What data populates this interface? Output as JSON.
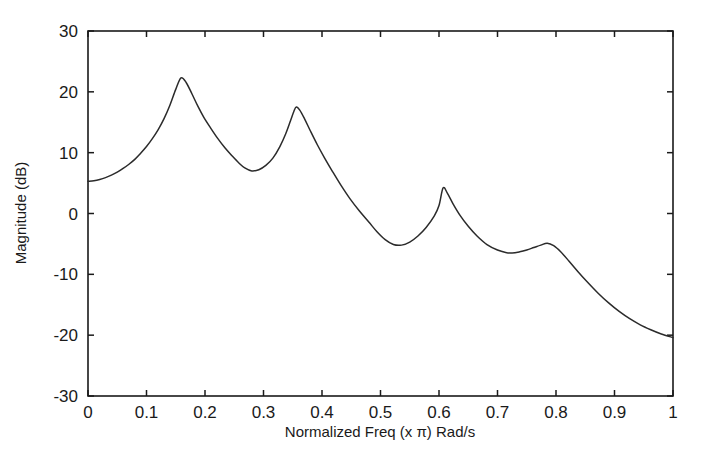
{
  "chart_data": {
    "type": "line",
    "title": "",
    "xlabel": "Normalized Freq (x π) Rad/s",
    "ylabel": "Magnitude (dB)",
    "xlim": [
      0,
      1
    ],
    "ylim": [
      -30,
      30
    ],
    "grid": false,
    "legend": null,
    "xticks": [
      0,
      0.1,
      0.2,
      0.3,
      0.4,
      0.5,
      0.6,
      0.7,
      0.8,
      0.9,
      1
    ],
    "xticklabels": [
      "0",
      "0.1",
      "0.2",
      "0.3",
      "0.4",
      "0.5",
      "0.6",
      "0.7",
      "0.8",
      "0.9",
      "1"
    ],
    "yticks": [
      30,
      20,
      10,
      0,
      -10,
      -20,
      -30
    ],
    "yticklabels": [
      "30",
      "20",
      "10",
      "0",
      "-10",
      "-20",
      "-30"
    ],
    "series": [
      {
        "name": "magnitude-response",
        "color": "#2b2b2b",
        "x": [
          0.0,
          0.01,
          0.02,
          0.03,
          0.04,
          0.05,
          0.06,
          0.07,
          0.08,
          0.09,
          0.1,
          0.11,
          0.12,
          0.13,
          0.14,
          0.15,
          0.159,
          0.168,
          0.178,
          0.188,
          0.198,
          0.21,
          0.222,
          0.234,
          0.246,
          0.258,
          0.268,
          0.28,
          0.292,
          0.304,
          0.316,
          0.328,
          0.338,
          0.346,
          0.352,
          0.356,
          0.362,
          0.37,
          0.38,
          0.392,
          0.404,
          0.418,
          0.432,
          0.448,
          0.464,
          0.48,
          0.494,
          0.508,
          0.522,
          0.536,
          0.55,
          0.564,
          0.578,
          0.592,
          0.6,
          0.607,
          0.614,
          0.624,
          0.636,
          0.65,
          0.665,
          0.682,
          0.7,
          0.714,
          0.725,
          0.738,
          0.75,
          0.762,
          0.774,
          0.785,
          0.796,
          0.808,
          0.822,
          0.838,
          0.854,
          0.872,
          0.89,
          0.908,
          0.926,
          0.944,
          0.962,
          0.98,
          1.0
        ],
        "y": [
          5.3,
          5.4,
          5.6,
          5.9,
          6.3,
          6.8,
          7.4,
          8.1,
          8.9,
          9.9,
          11.0,
          12.3,
          13.8,
          15.6,
          17.8,
          20.4,
          22.3,
          21.5,
          19.6,
          17.6,
          15.8,
          14.0,
          12.3,
          10.8,
          9.5,
          8.3,
          7.5,
          7.0,
          7.2,
          7.9,
          9.1,
          11.0,
          13.1,
          15.2,
          16.8,
          17.5,
          17.0,
          15.6,
          13.6,
          11.3,
          9.2,
          6.9,
          4.7,
          2.4,
          0.4,
          -1.4,
          -3.0,
          -4.3,
          -5.1,
          -5.2,
          -4.7,
          -3.7,
          -2.3,
          -0.4,
          1.3,
          4.2,
          3.4,
          1.6,
          -0.3,
          -2.1,
          -3.7,
          -5.1,
          -6.0,
          -6.4,
          -6.5,
          -6.3,
          -6.0,
          -5.6,
          -5.2,
          -4.9,
          -5.3,
          -6.3,
          -7.8,
          -9.6,
          -11.3,
          -13.1,
          -14.7,
          -16.1,
          -17.3,
          -18.3,
          -19.1,
          -19.8,
          -20.4
        ]
      }
    ]
  },
  "axis": {
    "xlabel": "Normalized Freq (x π) Rad/s",
    "ylabel": "Magnitude (dB)"
  }
}
